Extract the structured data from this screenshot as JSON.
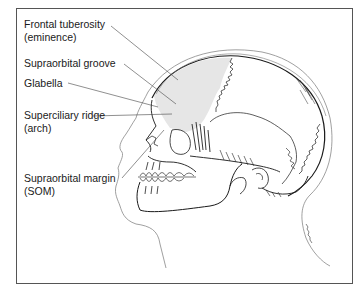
{
  "figure": {
    "type": "anatomical-illustration",
    "colors": {
      "frame_border": "#555555",
      "line": "#1a1a1a",
      "frontal_bone_shading": "#e6e6e6",
      "soft_tissue_outline": "#888888"
    }
  },
  "labels": [
    {
      "id": "frontal-tuberosity",
      "line1": "Frontal tuberosity",
      "line2": "(eminence)"
    },
    {
      "id": "supraorbital-groove",
      "line1": "Supraorbital groove",
      "line2": ""
    },
    {
      "id": "glabella",
      "line1": "Glabella",
      "line2": ""
    },
    {
      "id": "superciliary-ridge",
      "line1": "Superciliary ridge",
      "line2": "(arch)"
    },
    {
      "id": "supraorbital-margin",
      "line1": "Supraorbital margin",
      "line2": "(SOM)"
    }
  ],
  "signature": "artist-signature"
}
